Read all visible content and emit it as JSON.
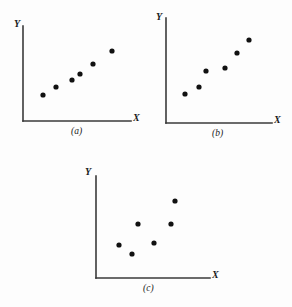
{
  "figure": {
    "background_color": "#fdfdfd",
    "axis_color": "#3a3a3a",
    "point_color": "#111111",
    "point_radius": 2.6
  },
  "chart_data": [
    {
      "type": "scatter",
      "title": "(a)",
      "caption": "(a)",
      "xlabel": "X",
      "ylabel": "Y",
      "grid": false,
      "legend": "none",
      "description": "strong positive linear relationship",
      "axis": {
        "origin_x": 23,
        "origin_y": 121,
        "x_end": 131,
        "y_top": 26
      },
      "xlim": [
        0,
        10
      ],
      "ylim": [
        0,
        10
      ],
      "points": [
        {
          "px": 43,
          "py": 95
        },
        {
          "px": 56,
          "py": 87
        },
        {
          "px": 72,
          "py": 80
        },
        {
          "px": 80,
          "py": 74
        },
        {
          "px": 93,
          "py": 64
        },
        {
          "px": 112,
          "py": 51
        }
      ],
      "x": [
        1.9,
        3.1,
        4.5,
        5.3,
        6.5,
        8.2
      ],
      "y": [
        2.7,
        3.6,
        4.3,
        4.9,
        6.0,
        7.4
      ],
      "labels": {
        "ylabel_pos": {
          "px": 16,
          "py": 22
        },
        "xlabel_pos": {
          "px": 134,
          "py": 114
        },
        "caption_pos": {
          "px": 72,
          "py": 128
        }
      }
    },
    {
      "type": "scatter",
      "title": "(b)",
      "caption": "(b)",
      "xlabel": "X",
      "ylabel": "Y",
      "grid": false,
      "legend": "none",
      "description": "positive linear relationship with more scatter",
      "axis": {
        "origin_x": 166,
        "origin_y": 123,
        "x_end": 272,
        "y_top": 18
      },
      "xlim": [
        0,
        10
      ],
      "ylim": [
        0,
        10
      ],
      "points": [
        {
          "px": 185,
          "py": 94
        },
        {
          "px": 199,
          "py": 87
        },
        {
          "px": 206,
          "py": 71
        },
        {
          "px": 225,
          "py": 68
        },
        {
          "px": 237,
          "py": 53
        },
        {
          "px": 249,
          "py": 40
        }
      ],
      "x": [
        1.8,
        3.1,
        3.8,
        5.6,
        6.7,
        7.8
      ],
      "y": [
        2.8,
        3.4,
        5.0,
        5.2,
        6.7,
        7.9
      ],
      "labels": {
        "ylabel_pos": {
          "px": 157,
          "py": 15
        },
        "xlabel_pos": {
          "px": 275,
          "py": 116
        },
        "caption_pos": {
          "px": 214,
          "py": 130
        }
      }
    },
    {
      "type": "scatter",
      "title": "(c)",
      "caption": "(c)",
      "xlabel": "X",
      "ylabel": "Y",
      "grid": false,
      "legend": "none",
      "description": "weak or no clear relationship, scattered points",
      "axis": {
        "origin_x": 96,
        "origin_y": 278,
        "x_end": 210,
        "y_top": 176
      },
      "xlim": [
        0,
        10
      ],
      "ylim": [
        0,
        10
      ],
      "points": [
        {
          "px": 119,
          "py": 245
        },
        {
          "px": 132,
          "py": 254
        },
        {
          "px": 138,
          "py": 224
        },
        {
          "px": 154,
          "py": 243
        },
        {
          "px": 171,
          "py": 224
        },
        {
          "px": 175,
          "py": 201
        }
      ],
      "x": [
        2.0,
        3.2,
        3.7,
        5.1,
        6.6,
        6.9
      ],
      "y": [
        3.2,
        2.4,
        5.3,
        3.4,
        5.3,
        7.5
      ],
      "labels": {
        "ylabel_pos": {
          "px": 86,
          "py": 170
        },
        "xlabel_pos": {
          "px": 213,
          "py": 271
        },
        "caption_pos": {
          "px": 145,
          "py": 285
        }
      }
    }
  ]
}
